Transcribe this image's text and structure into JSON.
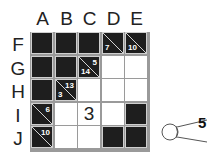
{
  "puzzle": {
    "type": "kakuro",
    "columns": [
      "A",
      "B",
      "C",
      "D",
      "E"
    ],
    "rows": [
      "F",
      "G",
      "H",
      "I",
      "J"
    ],
    "cells": [
      [
        {
          "kind": "black"
        },
        {
          "kind": "black"
        },
        {
          "kind": "black"
        },
        {
          "kind": "clue",
          "down": "7",
          "across": ""
        },
        {
          "kind": "clue",
          "down": "10",
          "across": ""
        }
      ],
      [
        {
          "kind": "black"
        },
        {
          "kind": "black"
        },
        {
          "kind": "clue",
          "down": "14",
          "across": "5"
        },
        {
          "kind": "white",
          "value": ""
        },
        {
          "kind": "white",
          "value": ""
        }
      ],
      [
        {
          "kind": "black"
        },
        {
          "kind": "clue",
          "down": "3",
          "across": "13"
        },
        {
          "kind": "white",
          "value": ""
        },
        {
          "kind": "white",
          "value": ""
        },
        {
          "kind": "white",
          "value": ""
        }
      ],
      [
        {
          "kind": "clue",
          "down": "",
          "across": "6"
        },
        {
          "kind": "white",
          "value": ""
        },
        {
          "kind": "white",
          "value": "3"
        },
        {
          "kind": "white",
          "value": ""
        },
        {
          "kind": "black"
        }
      ],
      [
        {
          "kind": "clue",
          "down": "",
          "across": "10"
        },
        {
          "kind": "white",
          "value": ""
        },
        {
          "kind": "white",
          "value": ""
        },
        {
          "kind": "black"
        },
        {
          "kind": "black"
        }
      ]
    ]
  },
  "hint_callout": {
    "text": "5"
  }
}
